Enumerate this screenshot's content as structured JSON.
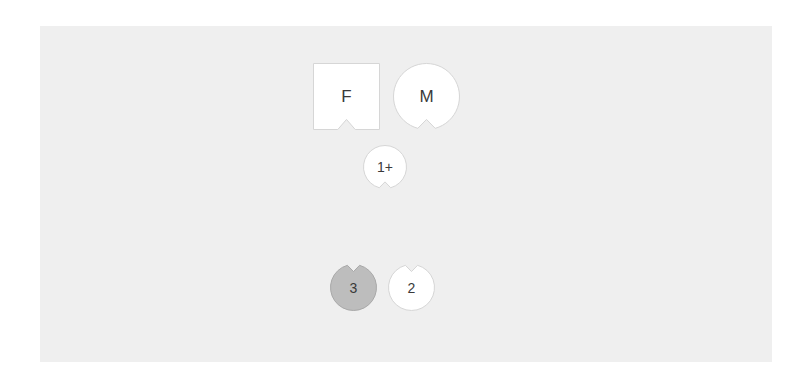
{
  "canvas": {
    "background": "#efefef"
  },
  "tokens": [
    {
      "id": "F",
      "label": "F",
      "shape": "square",
      "notch": "bottom",
      "fill": "#ffffff",
      "stroke": "#d6d6d6",
      "x": 313,
      "y": 63,
      "size": 67
    },
    {
      "id": "M",
      "label": "M",
      "shape": "circle",
      "notch": "bottom",
      "fill": "#ffffff",
      "stroke": "#d6d6d6",
      "x": 393,
      "y": 63,
      "size": 67
    },
    {
      "id": "1plus",
      "label": "1+",
      "shape": "circle",
      "notch": "bottom",
      "fill": "#ffffff",
      "stroke": "#d6d6d6",
      "x": 363,
      "y": 145,
      "size": 44
    },
    {
      "id": "3",
      "label": "3",
      "shape": "circle",
      "notch": "top",
      "fill": "#bdbdbd",
      "stroke": "#a8a8a8",
      "x": 330,
      "y": 264,
      "size": 47
    },
    {
      "id": "2",
      "label": "2",
      "shape": "circle",
      "notch": "top",
      "fill": "#ffffff",
      "stroke": "#d6d6d6",
      "x": 388,
      "y": 264,
      "size": 47
    }
  ]
}
